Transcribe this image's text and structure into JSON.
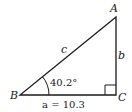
{
  "diagram": {
    "type": "right-triangle",
    "vertices": {
      "A": {
        "label": "A",
        "x": 116,
        "y": 17
      },
      "B": {
        "label": "B",
        "x": 20,
        "y": 95
      },
      "C": {
        "label": "C",
        "x": 116,
        "y": 95
      }
    },
    "sides": {
      "a": {
        "label": "a = 10.3",
        "name": "a",
        "value": "10.3"
      },
      "b": {
        "label": "b"
      },
      "c": {
        "label": "c"
      }
    },
    "angle_B": {
      "label": "40.2°",
      "value": 40.2
    },
    "right_angle_at": "C",
    "colors": {
      "stroke": "#1a1a1a",
      "background": "#ffffff"
    }
  }
}
